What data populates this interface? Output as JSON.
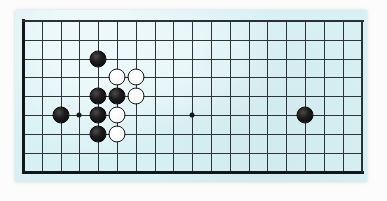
{
  "document": {
    "kind": "go-board-diagram",
    "title": "Go board position diagram"
  },
  "board": {
    "background_color": "#d6f0f3",
    "line_color": "#2e3437",
    "border_color": "#111619",
    "columns": 19,
    "rows": 9,
    "cell_size": 18.8,
    "origin_x": 8,
    "origin_y": 11,
    "label": "Go board"
  },
  "star_points": [
    {
      "col": 4,
      "row": 6,
      "name": "hoshi-left"
    },
    {
      "col": 10,
      "row": 6,
      "name": "hoshi-center"
    }
  ],
  "stones": [
    {
      "color": "black",
      "col": 3,
      "row": 6,
      "name": "black-stone-left-edge"
    },
    {
      "color": "black",
      "col": 5,
      "row": 3,
      "name": "black-stone-upper"
    },
    {
      "color": "black",
      "col": 5,
      "row": 5,
      "name": "black-stone-cluster-a"
    },
    {
      "color": "black",
      "col": 5,
      "row": 6,
      "name": "black-stone-cluster-b"
    },
    {
      "color": "black",
      "col": 5,
      "row": 7,
      "name": "black-stone-cluster-c"
    },
    {
      "color": "black",
      "col": 6,
      "row": 5,
      "name": "black-stone-cluster-d"
    },
    {
      "color": "white",
      "col": 6,
      "row": 4,
      "name": "white-stone-cluster-a"
    },
    {
      "color": "white",
      "col": 7,
      "row": 4,
      "name": "white-stone-cluster-b"
    },
    {
      "color": "white",
      "col": 7,
      "row": 5,
      "name": "white-stone-cluster-c"
    },
    {
      "color": "white",
      "col": 6,
      "row": 6,
      "name": "white-stone-cluster-d"
    },
    {
      "color": "white",
      "col": 6,
      "row": 7,
      "name": "white-stone-cluster-e"
    },
    {
      "color": "black",
      "col": 16,
      "row": 6,
      "name": "black-stone-right"
    }
  ],
  "stone_style": {
    "diameter": 17,
    "black_fill": "#0a0a0a",
    "white_fill": "#fafafa",
    "white_outline": "#15191b"
  },
  "counts": {
    "black_stones": 7,
    "white_stones": 5,
    "total_stones": 12
  }
}
